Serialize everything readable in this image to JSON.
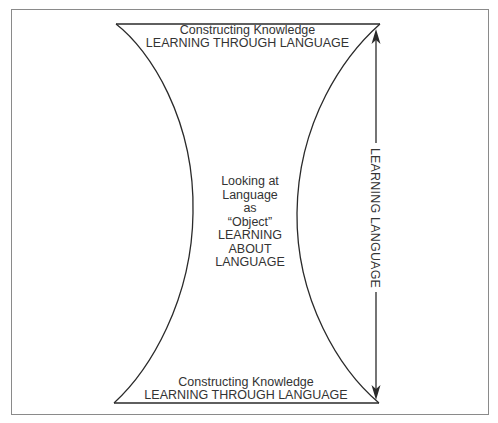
{
  "diagram": {
    "top_section": {
      "line1": "Constructing Knowledge",
      "line2": "LEARNING THROUGH LANGUAGE"
    },
    "middle_section": {
      "lines": [
        "Looking at",
        "Language",
        "as",
        "“Object”",
        "LEARNING",
        "ABOUT",
        "LANGUAGE"
      ]
    },
    "bottom_section": {
      "line1": "Constructing Knowledge",
      "line2": "LEARNING THROUGH LANGUAGE"
    },
    "axis": {
      "label": "LEARNING LANGUAGE",
      "direction": "bidirectional-vertical"
    },
    "colors": {
      "stroke": "#2a2a2a",
      "frame": "#8a8a8a",
      "background": "#ffffff"
    }
  }
}
